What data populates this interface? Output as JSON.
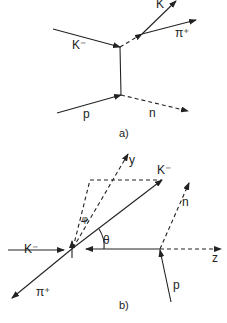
{
  "diagram_a": {
    "caption": "a)",
    "labels": {
      "k_minus_in": "K⁻",
      "k_out": "K",
      "pi_plus": "π⁺",
      "proton": "p",
      "neutron": "n"
    }
  },
  "diagram_b": {
    "caption": "b)",
    "labels": {
      "y_axis": "y",
      "z_axis": "z",
      "k_minus_out": "K⁻",
      "k_minus_in": "K⁻",
      "neutron": "n",
      "proton": "p",
      "pi_plus": "π⁺",
      "theta": "θ",
      "phi": "φ"
    }
  },
  "colors": {
    "ink": "#222222",
    "background": "#ffffff"
  }
}
